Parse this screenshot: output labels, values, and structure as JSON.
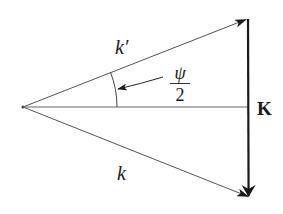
{
  "diagram": {
    "type": "vector-triangle",
    "labels": {
      "k_prime": "k′",
      "k": "k",
      "K": "K",
      "angle_numerator": "ψ",
      "angle_denominator": "2"
    },
    "colors": {
      "line": "#555555",
      "bold_line": "#1a1a1a",
      "text": "#1a1a1a",
      "background": "#ffffff"
    },
    "points": {
      "origin": [
        23,
        107
      ],
      "top_tip": [
        247,
        19
      ],
      "bottom_tip": [
        249,
        197
      ],
      "mid": [
        247,
        107
      ]
    },
    "vectors": [
      {
        "name": "k-prime",
        "from": "origin",
        "to": "top_tip"
      },
      {
        "name": "k",
        "from": "origin",
        "to": "bottom_tip"
      },
      {
        "name": "K",
        "from": "top_tip",
        "to": "bottom_tip"
      }
    ]
  }
}
